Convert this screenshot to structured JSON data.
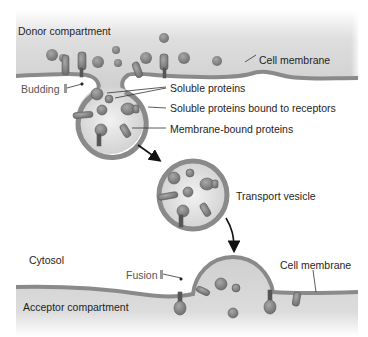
{
  "diagram": {
    "type": "vesicular-transport",
    "colors": {
      "compartment_fill": "#c8c8c8",
      "membrane": "#8a8a8a",
      "vesicle_interior": "#d6d6d6",
      "protein": "#7c7c7c",
      "text": "#1e1e1e",
      "arrow": "#111111"
    }
  },
  "labels": {
    "donor_compartment": "Donor compartment",
    "cell_membrane_top": "Cell membrane",
    "budding": "Budding",
    "soluble_proteins": "Soluble proteins",
    "soluble_bound": "Soluble proteins bound to receptors",
    "membrane_bound": "Membrane-bound proteins",
    "transport_vesicle": "Transport vesicle",
    "cytosol": "Cytosol",
    "fusion": "Fusion",
    "cell_membrane_bottom": "Cell membrane",
    "acceptor_compartment": "Acceptor compartment"
  }
}
